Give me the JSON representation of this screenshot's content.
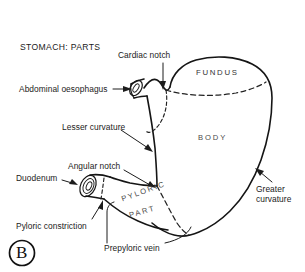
{
  "figure": {
    "title": "STOMACH: PARTS",
    "panel_letter": "B"
  },
  "regions": [
    {
      "name": "fundus-region-label",
      "text": "FUNDUS"
    },
    {
      "name": "body-region-label",
      "text": "BODY"
    },
    {
      "name": "pyloric-part-region-label-line1",
      "text": "PYLORIC"
    },
    {
      "name": "pyloric-part-region-label-line2",
      "text": "PART"
    }
  ],
  "labels": {
    "cardiac_notch": "Cardiac notch",
    "abdominal_oesophagus": "Abdominal oesophagus",
    "lesser_curvature": "Lesser curvature",
    "angular_notch": "Angular notch",
    "duodenum": "Duodenum",
    "pyloric_constriction": "Pyloric constriction",
    "prepyloric_vein": "Prepyloric vein",
    "greater_curvature_line1": "Greater",
    "greater_curvature_line2": "curvature",
    "fundus": "FUNDUS",
    "body": "BODY",
    "pyloric_part_line1": "PYLORIC",
    "pyloric_part_line2": "PART"
  },
  "colors": {
    "background": "#ffffff",
    "ink": "#151515",
    "label_text": "#1b1b1b",
    "region_text": "#4a4a4a",
    "dashed_line": "#222222"
  }
}
